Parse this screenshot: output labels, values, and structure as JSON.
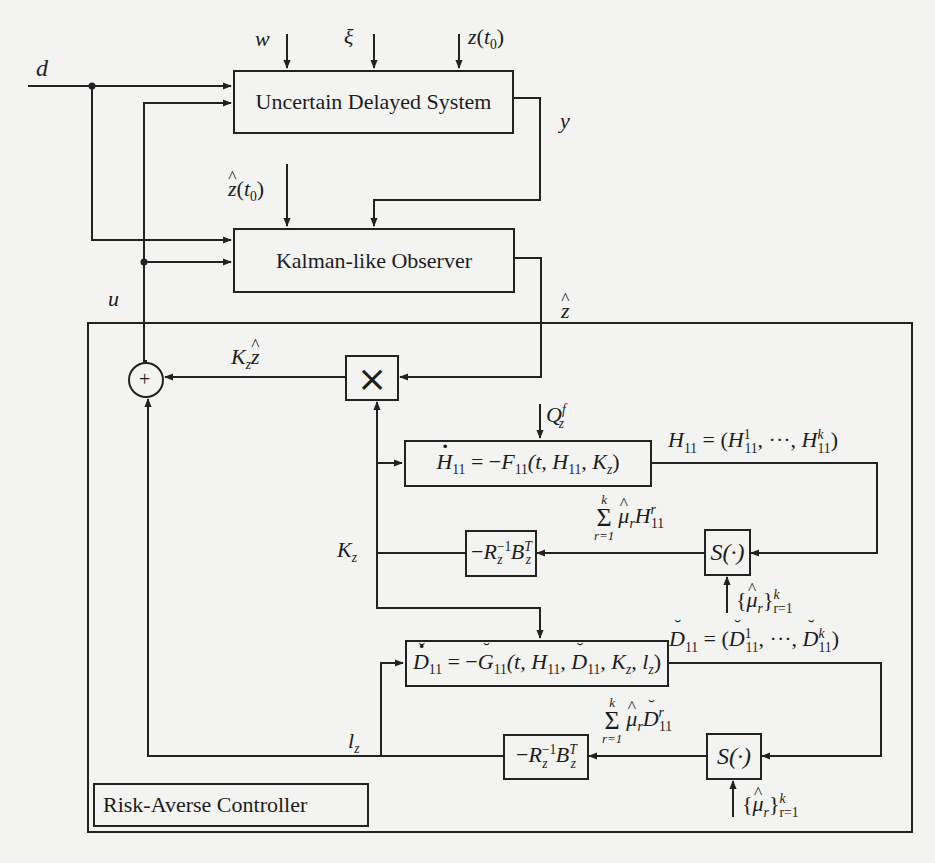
{
  "diagram": {
    "blocks": {
      "plant": "Uncertain Delayed System",
      "observer": "Kalman-like Observer",
      "controller_label": "Risk-Averse Controller",
      "multiplier": "×",
      "sum_node": "+",
      "gain_upper": {
        "minus": "−",
        "R": "R",
        "R_sub": "z",
        "R_sup": "−1",
        "B": "B",
        "B_sub": "z",
        "B_sup": "T"
      },
      "gain_lower": {
        "minus": "−",
        "R": "R",
        "R_sub": "z",
        "R_sup": "−1",
        "B": "B",
        "B_sub": "z",
        "B_sup": "T"
      },
      "selector_upper": "S(·)",
      "selector_lower": "S(·)",
      "riccati_H": {
        "lhs": "H",
        "lhs_sub": "11",
        "eq": " = −",
        "F": "F",
        "F_sub": "11",
        "args_open": "(t, ",
        "H": "H",
        "H_sub": "11",
        "comma": ", ",
        "K": "K",
        "K_sub": "z",
        "close": ")"
      },
      "riccati_D": {
        "lhs": "D",
        "lhs_sub": "11",
        "eq": " = −",
        "G": "G",
        "G_sub": "11",
        "args_open": "(t, ",
        "H": "H",
        "H_sub": "11",
        "comma1": ", ",
        "D": "D",
        "D_sub": "11",
        "comma2": ", ",
        "K": "K",
        "K_sub": "z",
        "comma3": ", ",
        "l": "l",
        "l_sub": "z",
        "close": ")"
      }
    },
    "signals": {
      "d": "d",
      "w": "w",
      "xi": "ξ",
      "z_t0": {
        "z": "z",
        "open": "(",
        "t": "t",
        "t_sub": "0",
        "close": ")"
      },
      "zhat_t0": {
        "z": "z",
        "open": "(",
        "t": "t",
        "t_sub": "0",
        "close": ")"
      },
      "y": "y",
      "u": "u",
      "zhat": "z",
      "Kz_zhat": {
        "K": "K",
        "K_sub": "z",
        "z": "z"
      },
      "Qz_f": {
        "Q": "Q",
        "Q_sub": "z",
        "Q_sup": "f"
      },
      "H11_tuple": {
        "lhs": "H",
        "lhs_sub": "11",
        "eq": " = (",
        "first": "H",
        "first_sub": "11",
        "first_sup": "1",
        "dots": ", ···, ",
        "last": "H",
        "last_sub": "11",
        "last_sup": "k",
        "close": ")"
      },
      "sum_H": {
        "top": "k",
        "bot": "r=1",
        "mu": "μ",
        "mu_sub": "r",
        "H": "H",
        "H_sub": "11",
        "H_sup": "r"
      },
      "mu_set_upper": {
        "open": "{",
        "mu": "μ",
        "mu_sub": "r",
        "close": "}",
        "sup": "k",
        "sub": "r=1"
      },
      "Kz": {
        "K": "K",
        "K_sub": "z"
      },
      "D11_tuple": {
        "lhs": "D",
        "lhs_sub": "11",
        "eq": " = (",
        "first": "D",
        "first_sub": "11",
        "first_sup": "1",
        "dots": ", ···, ",
        "last": "D",
        "last_sub": "11",
        "last_sup": "k",
        "close": ")"
      },
      "sum_D": {
        "top": "k",
        "bot": "r=1",
        "mu": "μ",
        "mu_sub": "r",
        "D": "D",
        "D_sub": "11",
        "D_sup": "r"
      },
      "mu_set_lower": {
        "open": "{",
        "mu": "μ",
        "mu_sub": "r",
        "close": "}",
        "sup": "k",
        "sub": "r=1"
      },
      "lz": {
        "l": "l",
        "l_sub": "z"
      }
    }
  }
}
